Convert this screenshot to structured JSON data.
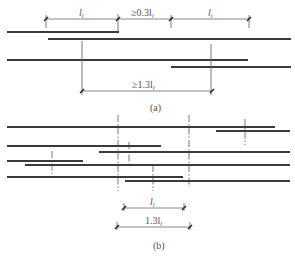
{
  "diagram": {
    "part_a": {
      "caption": "(a)",
      "top_dimensions": [
        {
          "label": "l",
          "sub": "l",
          "x1": 46,
          "x2": 118
        },
        {
          "label": "≥0.3l",
          "sub": "l",
          "x1": 118,
          "x2": 171
        },
        {
          "label": "l",
          "sub": "l",
          "x1": 171,
          "x2": 249
        }
      ],
      "bottom_dimension": {
        "label": "≥1.3l",
        "sub": "l",
        "x1": 82,
        "x2": 212
      },
      "bars": [
        {
          "y": 32,
          "x1": 7,
          "x2": 119
        },
        {
          "y": 39,
          "x1": 48,
          "x2": 291
        },
        {
          "y": 60,
          "x1": 7,
          "x2": 248
        },
        {
          "y": 67,
          "x1": 171,
          "x2": 291
        }
      ]
    },
    "part_b": {
      "caption": "(b)",
      "dimensions": [
        {
          "label": "l",
          "sub": "l",
          "x1": 124,
          "x2": 184
        },
        {
          "label": "1.3l",
          "sub": "l",
          "x1": 117,
          "x2": 190
        }
      ],
      "bars": [
        {
          "y": 127,
          "x1": 7,
          "x2": 275
        },
        {
          "y": 131,
          "x1": 216,
          "x2": 290
        },
        {
          "y": 146,
          "x1": 7,
          "x2": 161
        },
        {
          "y": 152,
          "x1": 99,
          "x2": 290
        },
        {
          "y": 161,
          "x1": 7,
          "x2": 83
        },
        {
          "y": 165,
          "x1": 25,
          "x2": 290
        },
        {
          "y": 177,
          "x1": 7,
          "x2": 183
        },
        {
          "y": 181,
          "x1": 125,
          "x2": 290
        }
      ]
    }
  }
}
